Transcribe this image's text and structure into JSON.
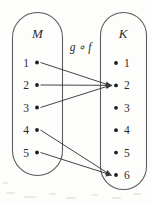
{
  "diagram": {
    "kind": "function-composition-mapping-diagram",
    "composition_label": "g ∘ f",
    "domain_set": {
      "name": "M",
      "elements": [
        "1",
        "2",
        "3",
        "4",
        "5"
      ]
    },
    "codomain_set": {
      "name": "K",
      "elements": [
        "1",
        "2",
        "3",
        "4",
        "5",
        "6"
      ]
    },
    "mappings": [
      {
        "from": "1",
        "to": "2"
      },
      {
        "from": "2",
        "to": "2"
      },
      {
        "from": "3",
        "to": "2"
      },
      {
        "from": "4",
        "to": "6"
      },
      {
        "from": "5",
        "to": "6"
      }
    ],
    "colors": {
      "background": "#fdfdfc",
      "outline": "#5a5a5a",
      "arrow": "#3a3a3a",
      "text": "#2b2b2b",
      "dot": "#1e1e1e"
    }
  }
}
